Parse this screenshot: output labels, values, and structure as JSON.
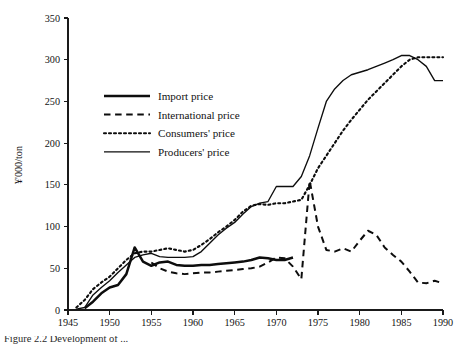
{
  "figure": {
    "caption_partial": "Figure 2.2  Development of ..."
  },
  "chart_data": {
    "type": "line",
    "title": "",
    "subtitle": "",
    "xlabel": "",
    "ylabel": "¥'000/ton",
    "xlim": [
      1945,
      1990
    ],
    "ylim": [
      0,
      350
    ],
    "grid": false,
    "legend_position": "upper-left-inside",
    "x_ticks": [
      1945,
      1950,
      1955,
      1960,
      1965,
      1970,
      1975,
      1980,
      1985,
      1990
    ],
    "y_ticks": [
      0,
      50,
      100,
      150,
      200,
      250,
      300,
      350
    ],
    "x_tick_labels": [
      "1945",
      "1950",
      "1955",
      "1960",
      "1965",
      "1970",
      "1975",
      "1980",
      "1985",
      "1990"
    ],
    "y_tick_labels": [
      "0",
      "50",
      "100",
      "150",
      "200",
      "250",
      "300",
      "350"
    ],
    "series": [
      {
        "name": "Import price",
        "style": "thick-solid",
        "color": "#0d0d0d",
        "x": [
          1947,
          1948,
          1949,
          1950,
          1951,
          1952,
          1953,
          1954,
          1955,
          1956,
          1957,
          1958,
          1959,
          1960,
          1961,
          1962,
          1963,
          1964,
          1965,
          1966,
          1967,
          1968,
          1969,
          1970,
          1971,
          1972
        ],
        "values": [
          2,
          10,
          20,
          27,
          30,
          43,
          75,
          58,
          53,
          57,
          58,
          54,
          53,
          53,
          54,
          54,
          55,
          56,
          57,
          58,
          60,
          63,
          62,
          60,
          60,
          63
        ]
      },
      {
        "name": "International price",
        "style": "dashed",
        "color": "#0d0d0d",
        "x": [
          1955,
          1956,
          1957,
          1958,
          1959,
          1960,
          1961,
          1962,
          1963,
          1964,
          1965,
          1966,
          1967,
          1968,
          1969,
          1970,
          1971,
          1972,
          1973,
          1974,
          1975,
          1976,
          1977,
          1978,
          1979,
          1980,
          1981,
          1982,
          1983,
          1984,
          1985,
          1986,
          1987,
          1988,
          1989,
          1990
        ],
        "values": [
          57,
          50,
          46,
          44,
          43,
          44,
          45,
          45,
          46,
          47,
          48,
          49,
          50,
          52,
          57,
          63,
          62,
          52,
          37,
          155,
          100,
          72,
          70,
          74,
          70,
          83,
          95,
          90,
          75,
          66,
          58,
          46,
          33,
          32,
          35,
          32
        ]
      },
      {
        "name": "Consumers' price",
        "style": "dotted",
        "color": "#0d0d0d",
        "x": [
          1946,
          1947,
          1948,
          1949,
          1950,
          1951,
          1952,
          1953,
          1954,
          1955,
          1956,
          1957,
          1958,
          1959,
          1960,
          1961,
          1962,
          1963,
          1964,
          1965,
          1966,
          1967,
          1968,
          1969,
          1970,
          1971,
          1972,
          1973,
          1974,
          1975,
          1976,
          1977,
          1978,
          1979,
          1980,
          1981,
          1982,
          1983,
          1984,
          1985,
          1986,
          1987,
          1988,
          1989,
          1990
        ],
        "values": [
          3,
          12,
          25,
          33,
          40,
          50,
          60,
          68,
          70,
          70,
          72,
          74,
          72,
          70,
          72,
          78,
          85,
          93,
          100,
          108,
          118,
          125,
          127,
          126,
          128,
          128,
          130,
          132,
          150,
          170,
          185,
          200,
          215,
          228,
          240,
          252,
          262,
          272,
          282,
          292,
          300,
          303,
          303,
          303,
          303
        ]
      },
      {
        "name": "Producers' price",
        "style": "thin-solid",
        "color": "#0d0d0d",
        "x": [
          1946,
          1947,
          1948,
          1949,
          1950,
          1951,
          1952,
          1953,
          1954,
          1955,
          1956,
          1957,
          1958,
          1959,
          1960,
          1961,
          1962,
          1963,
          1964,
          1965,
          1966,
          1967,
          1968,
          1969,
          1970,
          1971,
          1972,
          1973,
          1974,
          1975,
          1976,
          1977,
          1978,
          1979,
          1980,
          1981,
          1982,
          1983,
          1984,
          1985,
          1986,
          1987,
          1988,
          1989,
          1990
        ],
        "values": [
          1,
          3,
          18,
          27,
          35,
          45,
          54,
          63,
          66,
          68,
          64,
          63,
          63,
          63,
          64,
          70,
          80,
          90,
          98,
          105,
          115,
          124,
          128,
          130,
          148,
          148,
          148,
          160,
          185,
          218,
          250,
          265,
          275,
          282,
          285,
          288,
          292,
          296,
          300,
          305,
          305,
          300,
          292,
          275,
          275
        ]
      }
    ],
    "legend": [
      {
        "label": "Import price",
        "style": "thick-solid"
      },
      {
        "label": "International price",
        "style": "dashed"
      },
      {
        "label": "Consumers' price",
        "style": "dotted"
      },
      {
        "label": "Producers' price",
        "style": "thin-solid"
      }
    ]
  }
}
